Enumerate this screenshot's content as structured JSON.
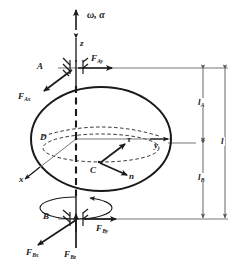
{
  "figure": {
    "type": "free-body-diagram",
    "stroke_color": "#1a1a1a",
    "dimension_color": "#555555",
    "background": "#ffffff"
  },
  "axes": {
    "z": {
      "label": "z",
      "direction": "up",
      "style": "dashed"
    },
    "y": {
      "label": "y",
      "direction": "right",
      "style": "solid"
    },
    "x": {
      "label": "x",
      "direction": "down-left",
      "style": "solid"
    }
  },
  "motion": {
    "label": "ω, α",
    "omega": "ω",
    "alpha": "α",
    "rotation_indicator": "spin-ellipse"
  },
  "points": {
    "A": {
      "label": "A",
      "role": "upper-bearing"
    },
    "B": {
      "label": "B",
      "role": "lower-bearing"
    },
    "C": {
      "label": "C",
      "role": "center-of-mass"
    },
    "D": {
      "label": "D",
      "role": "geometric-center-on-axis"
    }
  },
  "acceleration_vectors": [
    {
      "name": "tau",
      "label": "τ",
      "direction": "up-right",
      "from": "C"
    },
    {
      "name": "n",
      "label": "n",
      "direction": "down-right",
      "from": "C"
    }
  ],
  "forces": [
    {
      "name": "F_Ay",
      "base": "F",
      "sub": "Ay",
      "at": "A",
      "direction": "right"
    },
    {
      "name": "F_Ax",
      "base": "F",
      "sub": "Ax",
      "at": "A",
      "direction": "down-left"
    },
    {
      "name": "F_By",
      "base": "F",
      "sub": "By",
      "at": "B",
      "direction": "right"
    },
    {
      "name": "F_Bx",
      "base": "F",
      "sub": "Bx",
      "at": "B",
      "direction": "down-left"
    },
    {
      "name": "F_Bz",
      "base": "F",
      "sub": "Bz",
      "at": "B",
      "direction": "up"
    }
  ],
  "dimensions": [
    {
      "name": "l_A",
      "base": "l",
      "sub": "A",
      "span": "A to D",
      "position": "upper"
    },
    {
      "name": "l_B",
      "base": "l",
      "sub": "B",
      "span": "D to B",
      "position": "lower"
    },
    {
      "name": "l",
      "base": "l",
      "sub": "",
      "span": "A to B",
      "position": "outer"
    }
  ]
}
